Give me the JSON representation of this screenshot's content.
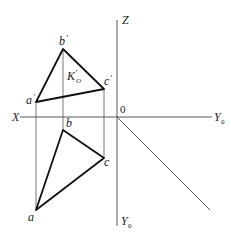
{
  "diagram": {
    "title": "",
    "axes": {
      "x_label": "X",
      "z_label": "Z",
      "yw_label": "Y",
      "yw_sub": "0",
      "yh_label": "Y",
      "yh_sub": "0",
      "origin_label": "0"
    },
    "front_view": {
      "vertices": [
        {
          "name": "a",
          "prime": "′",
          "x": 36,
          "y": 102
        },
        {
          "name": "b",
          "prime": "′",
          "x": 63,
          "y": 49
        },
        {
          "name": "c",
          "prime": "′",
          "x": 104,
          "y": 89
        }
      ],
      "region_label": "K",
      "region_prime": "′",
      "region_sub": "O"
    },
    "top_view": {
      "vertices": [
        {
          "name": "a",
          "x": 36,
          "y": 210
        },
        {
          "name": "b",
          "x": 63,
          "y": 130
        },
        {
          "name": "c",
          "x": 104,
          "y": 158
        }
      ]
    },
    "colors": {
      "line": "#333333",
      "thick": "#111111",
      "background": "#ffffff"
    }
  }
}
